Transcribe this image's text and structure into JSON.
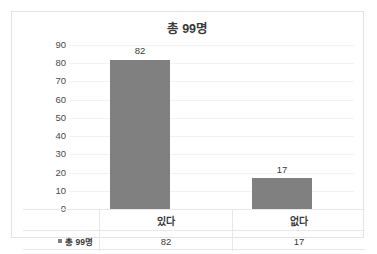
{
  "chart_data": {
    "type": "bar",
    "title": "총 99명",
    "categories": [
      "있다",
      "없다"
    ],
    "values": [
      82,
      17
    ],
    "series": [
      {
        "name": "총 99명",
        "values": [
          82,
          17
        ]
      }
    ],
    "xlabel": "",
    "ylabel": "",
    "ylim": [
      0,
      90
    ],
    "yticks": [
      0,
      10,
      20,
      30,
      40,
      50,
      60,
      70,
      80,
      90
    ],
    "ytick_labels": [
      "0",
      "10",
      "20",
      "30",
      "40",
      "50",
      "60",
      "70",
      "80",
      "90"
    ],
    "data_labels": [
      "82",
      "17"
    ],
    "grid": true,
    "legend_position": "none",
    "bar_color": "#808080",
    "data_table": {
      "legend_label": "총 99명",
      "columns": [
        "있다",
        "없다"
      ],
      "values": [
        "82",
        "17"
      ]
    }
  }
}
